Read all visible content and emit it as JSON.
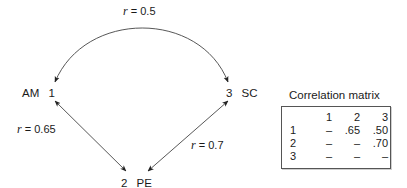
{
  "diagram": {
    "nodes": [
      {
        "id": "1",
        "name": "AM",
        "label_left": "AM",
        "label_right": "1"
      },
      {
        "id": "2",
        "name": "PE",
        "label_left": "2",
        "label_right": "PE"
      },
      {
        "id": "3",
        "name": "SC",
        "label_left": "3",
        "label_right": "SC"
      }
    ],
    "edges": [
      {
        "from": "1",
        "to": "3",
        "r_symbol": "r",
        "r_value": "= 0.5",
        "shape": "arc",
        "arrows": "both"
      },
      {
        "from": "1",
        "to": "2",
        "r_symbol": "r",
        "r_value": "= 0.65",
        "shape": "line",
        "arrows": "both"
      },
      {
        "from": "3",
        "to": "2",
        "r_symbol": "r",
        "r_value": "= 0.7",
        "shape": "line",
        "arrows": "both"
      }
    ],
    "stroke_color": "#333333"
  },
  "matrix": {
    "title": "Correlation matrix",
    "columns": [
      "",
      "1",
      "2",
      "3"
    ],
    "rows": [
      [
        "1",
        "–",
        ".65",
        ".50"
      ],
      [
        "2",
        "–",
        "–",
        ".70"
      ],
      [
        "3",
        "–",
        "–",
        "–"
      ]
    ]
  }
}
